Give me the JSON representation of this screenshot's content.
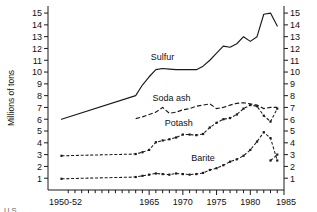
{
  "chart_data": {
    "type": "line",
    "title": "",
    "xlabel": "",
    "ylabel": "Millions of tons",
    "ylim": [
      0,
      15.6
    ],
    "xlim": [
      1950,
      1985
    ],
    "grid": false,
    "legend": "inline-labels",
    "y_ticks": [
      1,
      2,
      3,
      4,
      5,
      6,
      7,
      8,
      9,
      10,
      11,
      12,
      13,
      14,
      15
    ],
    "y_tick_labels": [
      "1",
      "2",
      "3",
      "4",
      "5",
      "6",
      "7",
      "8",
      "9",
      "10",
      "11",
      "12",
      "13",
      "14",
      "15"
    ],
    "right_axis": true,
    "right_y_tick_labels": [
      "1",
      "2",
      "3",
      "4",
      "5",
      "6",
      "7",
      "8",
      "9",
      "10",
      "11",
      "12",
      "13",
      "14",
      "15"
    ],
    "x_ticks": [
      1952,
      1965,
      1970,
      1975,
      1980,
      1985
    ],
    "x_tick_labels": [
      "1950-52",
      "1965",
      "1970",
      "1975",
      "1980",
      "1985"
    ],
    "x_minor_tick_interval": 1,
    "series": [
      {
        "name": "Sulfur",
        "style": "solid",
        "markers": false,
        "label_x": 1967.0,
        "label_y": 11.05,
        "x": [
          1952,
          1963,
          1964,
          1965,
          1966,
          1967,
          1968,
          1969,
          1970,
          1971,
          1972,
          1973,
          1974,
          1975,
          1976,
          1977,
          1978,
          1979,
          1980,
          1981,
          1982,
          1983,
          1984
        ],
        "values": [
          6.0,
          8.0,
          8.9,
          9.6,
          10.2,
          10.3,
          10.25,
          10.2,
          10.2,
          10.2,
          10.2,
          10.5,
          11.0,
          11.6,
          12.2,
          12.1,
          12.4,
          13.0,
          12.6,
          13.0,
          14.9,
          15.0,
          13.9
        ]
      },
      {
        "name": "Soda ash",
        "style": "dashed",
        "markers": false,
        "label_x": 1968.3,
        "label_y": 7.55,
        "x": [
          1963,
          1964,
          1965,
          1966,
          1967,
          1968,
          1969,
          1970,
          1971,
          1972,
          1973,
          1974,
          1975,
          1976,
          1977,
          1978,
          1979,
          1980,
          1981,
          1982,
          1983,
          1984
        ],
        "values": [
          6.05,
          6.2,
          6.4,
          6.6,
          7.0,
          6.5,
          6.6,
          6.8,
          6.9,
          7.1,
          7.2,
          7.3,
          6.9,
          7.0,
          7.2,
          7.35,
          7.4,
          7.3,
          7.2,
          6.9,
          7.0,
          7.0
        ]
      },
      {
        "name": "Potash",
        "style": "dashed-markers",
        "markers": true,
        "label_x": 1969.4,
        "label_y": 5.45,
        "x": [
          1952,
          1963,
          1964,
          1965,
          1966,
          1967,
          1968,
          1969,
          1970,
          1971,
          1972,
          1973,
          1974,
          1975,
          1976,
          1977,
          1978,
          1979,
          1980,
          1981,
          1982,
          1983,
          1984
        ],
        "values": [
          2.9,
          3.05,
          3.2,
          3.4,
          4.05,
          4.2,
          4.3,
          4.45,
          4.7,
          4.7,
          4.65,
          4.75,
          5.3,
          5.7,
          6.0,
          6.1,
          6.4,
          6.9,
          7.2,
          7.1,
          6.3,
          5.8,
          6.9
        ]
      },
      {
        "name": "Barite",
        "style": "dashed-markers",
        "markers": true,
        "label_x": 1973.0,
        "label_y": 2.45,
        "x": [
          1952,
          1963,
          1964,
          1965,
          1966,
          1967,
          1968,
          1969,
          1970,
          1971,
          1972,
          1973,
          1974,
          1975,
          1976,
          1977,
          1978,
          1979,
          1980,
          1981,
          1982,
          1983,
          1984
        ],
        "values": [
          0.95,
          1.1,
          1.2,
          1.3,
          1.4,
          1.35,
          1.3,
          1.4,
          1.35,
          1.3,
          1.35,
          1.45,
          1.7,
          1.85,
          2.1,
          2.4,
          2.6,
          2.9,
          3.4,
          4.1,
          4.9,
          4.4,
          2.5
        ]
      }
    ],
    "barite_tail": {
      "x": [
        1983,
        1984
      ],
      "values": [
        2.5,
        3.0
      ]
    }
  },
  "footnote": "U.S."
}
